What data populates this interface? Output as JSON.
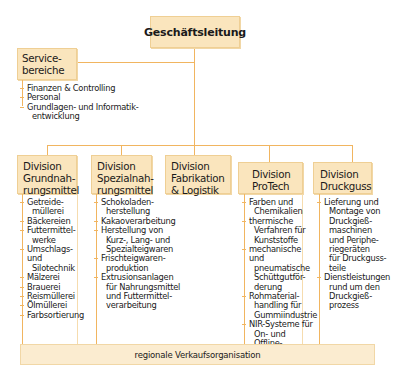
{
  "top": {
    "label": "Geschäftsleitung"
  },
  "service": {
    "label_line1": "Service-",
    "label_line2": "bereiche",
    "items": [
      {
        "line1": "Finanzen & Controlling"
      },
      {
        "line1": "Personal"
      },
      {
        "line1": "Grundlagen- und Informatik-",
        "line2": "entwicklung"
      }
    ]
  },
  "divisions": [
    {
      "line1": "Division",
      "line2": "Grundnah-",
      "line3": "rungsmittel",
      "items": [
        {
          "line1": "Getreide-",
          "line2": "müllerei"
        },
        {
          "line1": "Bäckereien"
        },
        {
          "line1": "Futtermittel-",
          "line2": "werke"
        },
        {
          "line1": "Umschlags- und",
          "line2": "Silotechnik"
        },
        {
          "line1": "Mälzerei"
        },
        {
          "line1": "Brauerei"
        },
        {
          "line1": "Reismüllerei"
        },
        {
          "line1": "Ölmüllerei"
        },
        {
          "line1": "Farbsortierung"
        }
      ]
    },
    {
      "line1": "Division",
      "line2": "Spezialnah-",
      "line3": "rungsmittel",
      "items": [
        {
          "line1": "Schokoladen-",
          "line2": "herstellung"
        },
        {
          "line1": "Kakaoverarbeitung"
        },
        {
          "line1": "Herstellung von",
          "line2": "Kurz-, Lang- und",
          "line3": "Spezialteigwaren"
        },
        {
          "line1": "Frischteigwaren-",
          "line2": "produktion"
        },
        {
          "line1": "Extrusionsanlagen",
          "line2": "für Nahrungsmittel",
          "line3": "und Futtermittel-",
          "line4": "verarbeitung"
        }
      ]
    },
    {
      "line1": "Division",
      "line2": "Fabrikation",
      "line3": "& Logistik",
      "items": []
    },
    {
      "line1": "Division",
      "line2": "ProTech",
      "items": [
        {
          "line1": "Farben und",
          "line2": "Chemikalien"
        },
        {
          "line1": "thermische",
          "line2": "Verfahren für",
          "line3": "Kunststoffe"
        },
        {
          "line1": "mechanische und",
          "line2": "pneumatische",
          "line3": "Schüttgutför-",
          "line4": "derung"
        },
        {
          "line1": "Rohmaterial-",
          "line2": "handling für",
          "line3": "Gummiindustrie"
        },
        {
          "line1": "NIR-Systeme für",
          "line2": "On- und Offline-",
          "line3": "Analysen"
        }
      ]
    },
    {
      "line1": "Division",
      "line2": "Druckguss",
      "items": [
        {
          "line1": "Lieferung und",
          "line2": "Montage von",
          "line3": "Druckgieß-",
          "line4": "maschinen",
          "line5": "und Periphe-",
          "line6": "riegeräten",
          "line7": "für Druckguss-",
          "line8": "teile"
        },
        {
          "line1": "Dienstleistungen",
          "line2": "rund um den",
          "line3": "Druckgieß-",
          "line4": "prozess"
        }
      ]
    }
  ],
  "bottom": {
    "label": "regionale Verkaufsorganisation"
  },
  "colors": {
    "box_fill": "#fae5bd",
    "box_border": "#efcf94",
    "connector": "#f1b560",
    "bottom_fill": "#fbecd0"
  }
}
